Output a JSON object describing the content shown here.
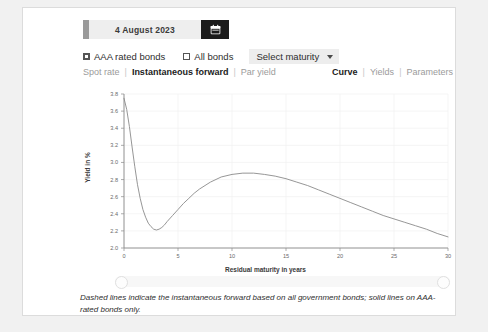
{
  "date_picker": {
    "value": "4 August 2023",
    "calendar_icon": "calendar-icon"
  },
  "filters": {
    "aaa_label": "AAA rated bonds",
    "aaa_checked": true,
    "all_label": "All bonds",
    "all_checked": false,
    "maturity_select_label": "Select maturity",
    "caret_icon": "chevron-down-icon"
  },
  "nav_left": {
    "items": [
      "Spot rate",
      "Instantaneous forward",
      "Par yield"
    ],
    "active": "Instantaneous forward",
    "sep": "|"
  },
  "nav_right": {
    "items": [
      "Curve",
      "Yields",
      "Parameters"
    ],
    "active": "Curve",
    "sep": "|"
  },
  "caption": "Dashed lines indicate the instantaneous forward based on all government bonds; solid lines on AAA-rated bonds only.",
  "colors": {
    "curve": "#8a8a8a",
    "axis": "#8a8a8a",
    "grid": "#f0f0f0",
    "card": "#ffffff",
    "page": "#f1f1f1",
    "accent_dark": "#1c1c1c"
  },
  "chart_data": {
    "type": "line",
    "title": "",
    "xlabel": "Residual maturity in years",
    "ylabel": "Yield in %",
    "xlim": [
      0,
      30
    ],
    "ylim": [
      2.0,
      3.8
    ],
    "xticks": [
      0,
      5,
      10,
      15,
      20,
      25,
      30
    ],
    "yticks": [
      2.0,
      2.2,
      2.4,
      2.6,
      2.8,
      3.0,
      3.2,
      3.4,
      3.6,
      3.8
    ],
    "grid": true,
    "legend": null,
    "series": [
      {
        "name": "AAA rated bonds instantaneous forward",
        "style": "solid",
        "x": [
          0,
          0.25,
          0.5,
          0.75,
          1,
          1.25,
          1.5,
          1.75,
          2,
          2.25,
          2.5,
          2.75,
          3,
          3.25,
          3.5,
          3.75,
          4,
          4.5,
          5,
          5.5,
          6,
          6.5,
          7,
          7.5,
          8,
          9,
          10,
          11,
          12,
          13,
          14,
          15,
          16,
          17,
          18,
          19,
          20,
          21,
          22,
          23,
          24,
          25,
          26,
          27,
          28,
          29,
          30
        ],
        "y": [
          3.75,
          3.62,
          3.42,
          3.18,
          2.95,
          2.74,
          2.58,
          2.45,
          2.36,
          2.29,
          2.25,
          2.22,
          2.21,
          2.22,
          2.24,
          2.27,
          2.31,
          2.38,
          2.45,
          2.52,
          2.58,
          2.64,
          2.69,
          2.73,
          2.77,
          2.83,
          2.86,
          2.875,
          2.875,
          2.86,
          2.84,
          2.81,
          2.77,
          2.73,
          2.68,
          2.63,
          2.58,
          2.53,
          2.48,
          2.43,
          2.38,
          2.34,
          2.3,
          2.26,
          2.22,
          2.17,
          2.13
        ]
      }
    ]
  },
  "slider": {
    "left_handle": "slider-handle-left",
    "right_handle": "slider-handle-right"
  }
}
